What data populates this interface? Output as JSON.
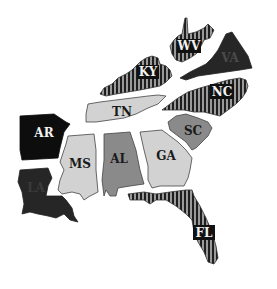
{
  "map": {
    "title": "Southeastern United States",
    "colors": {
      "light": "#d2d2d2",
      "medium": "#8a8a8a",
      "dark": "#262626",
      "black": "#0d0d0d",
      "stripe_bg": "#9a9a9a",
      "stripe_fg": "#1e1e1e",
      "outline": "#333333"
    },
    "states": [
      {
        "abbr": "WV",
        "fill": "striped"
      },
      {
        "abbr": "KY",
        "fill": "striped"
      },
      {
        "abbr": "VA",
        "fill": "dark"
      },
      {
        "abbr": "NC",
        "fill": "striped"
      },
      {
        "abbr": "TN",
        "fill": "light"
      },
      {
        "abbr": "SC",
        "fill": "medium"
      },
      {
        "abbr": "AR",
        "fill": "black"
      },
      {
        "abbr": "MS",
        "fill": "light"
      },
      {
        "abbr": "AL",
        "fill": "medium"
      },
      {
        "abbr": "GA",
        "fill": "light"
      },
      {
        "abbr": "LA",
        "fill": "dark"
      },
      {
        "abbr": "FL",
        "fill": "striped"
      }
    ]
  }
}
